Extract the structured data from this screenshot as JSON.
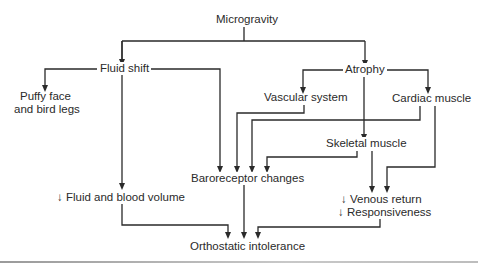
{
  "diagram": {
    "type": "flowchart",
    "nodes": {
      "microgravity": "Microgravity",
      "fluid_shift": "Fluid shift",
      "atrophy": "Atrophy",
      "puffy_face_line1": "Puffy face",
      "puffy_face_line2": "and bird legs",
      "vascular_system": "Vascular system",
      "cardiac_muscle": "Cardiac muscle",
      "skeletal_muscle": "Skeletal muscle",
      "baroreceptor_changes": "Baroreceptor changes",
      "fluid_blood_volume": "↓ Fluid and blood volume",
      "venous_return": "↓ Venous return",
      "responsiveness": "↓ Responsiveness",
      "orthostatic_intolerance": "Orthostatic intolerance"
    },
    "edges": [
      {
        "from": "Microgravity",
        "to": "Fluid shift"
      },
      {
        "from": "Microgravity",
        "to": "Atrophy"
      },
      {
        "from": "Fluid shift",
        "to": "Puffy face and bird legs"
      },
      {
        "from": "Fluid shift",
        "to": "Baroreceptor changes"
      },
      {
        "from": "Fluid shift",
        "to": "↓ Fluid and blood volume"
      },
      {
        "from": "Atrophy",
        "to": "Vascular system"
      },
      {
        "from": "Atrophy",
        "to": "Cardiac muscle"
      },
      {
        "from": "Atrophy",
        "to": "Skeletal muscle"
      },
      {
        "from": "Vascular system",
        "to": "Baroreceptor changes"
      },
      {
        "from": "Cardiac muscle",
        "to": "Baroreceptor changes"
      },
      {
        "from": "Cardiac muscle",
        "to": "↓ Venous return / ↓ Responsiveness"
      },
      {
        "from": "Skeletal muscle",
        "to": "Baroreceptor changes"
      },
      {
        "from": "Skeletal muscle",
        "to": "↓ Venous return / ↓ Responsiveness"
      },
      {
        "from": "Baroreceptor changes",
        "to": "Orthostatic intolerance"
      },
      {
        "from": "↓ Fluid and blood volume",
        "to": "Orthostatic intolerance"
      },
      {
        "from": "↓ Venous return / ↓ Responsiveness",
        "to": "Orthostatic intolerance"
      }
    ],
    "colors": {
      "line": "#2a2a2a",
      "text": "#2a2a2a",
      "background": "#ffffff",
      "rule": "#a8a8a8"
    }
  }
}
